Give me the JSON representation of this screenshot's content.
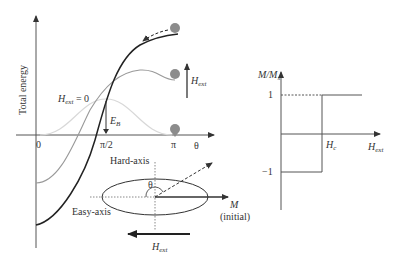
{
  "left_panel": {
    "y_axis_label": "Total energy",
    "x_axis_label": "θ",
    "x_ticks": [
      "0",
      "π/2",
      "π"
    ],
    "hext_zero_label": "H",
    "hext_zero_sub": "ext",
    "hext_zero_suffix": " = 0",
    "barrier_label": "E",
    "barrier_sub": "B",
    "hext_up_label": "H",
    "hext_up_sub": "ext",
    "curves": [
      {
        "name": "zero-field",
        "color": "#d8d8d8"
      },
      {
        "name": "intermediate-field",
        "color": "#999999"
      },
      {
        "name": "high-field",
        "color": "#222222"
      }
    ]
  },
  "inset": {
    "hard_axis_label": "Hard-axis",
    "easy_axis_label": "Easy-axis",
    "theta_label": "θ",
    "m_label": "M",
    "m_sublabel": "(initial)",
    "hext_label": "H",
    "hext_sub": "ext"
  },
  "right_panel": {
    "y_axis_label": "M/M",
    "y_axis_sub": "s",
    "y_ticks": [
      "1",
      "−1"
    ],
    "hc_label": "H",
    "hc_sub": "c",
    "x_axis_label": "H",
    "x_axis_sub": "ext"
  },
  "colors": {
    "ball": "#8c8c8c",
    "axis": "#444444"
  }
}
